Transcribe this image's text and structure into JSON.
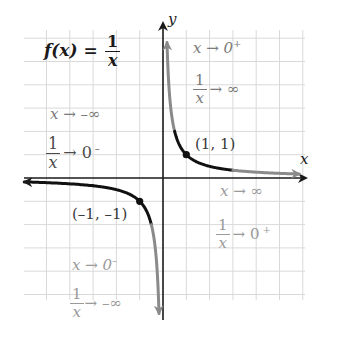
{
  "title": {
    "lhs": "f(x) =",
    "numerator": "1",
    "denominator": "x"
  },
  "axes": {
    "x_label": "x",
    "y_label": "y",
    "origin_px": [
      163,
      178
    ],
    "unit_px": 23.3,
    "grid_range_x": [
      -5,
      6
    ],
    "grid_range_y": [
      -6,
      6
    ]
  },
  "points": [
    {
      "label": "(1, 1)",
      "x": 1,
      "y": 1
    },
    {
      "label": "(-1, -1)",
      "display": "(–1, –1)",
      "x": -1,
      "y": -1
    }
  ],
  "annotations": {
    "q2_top": {
      "limit": "x → –∞",
      "value_num": "1",
      "value_den": "x",
      "value_tail": "→ 0",
      "value_sup": "–"
    },
    "q1_top": {
      "limit": "x → 0",
      "limit_sup": "+",
      "value_num": "1",
      "value_den": "x",
      "value_tail": "→ ∞"
    },
    "q4": {
      "limit": "x → ∞",
      "value_num": "1",
      "value_den": "x",
      "value_tail": "→ 0",
      "value_sup": "+"
    },
    "q3": {
      "limit": "x → 0",
      "limit_sup": "–",
      "value_num": "1",
      "value_den": "x",
      "value_tail": "→ –∞"
    }
  },
  "colors": {
    "axis": "#1a1a1a",
    "curve_near": "#111111",
    "curve_far": "#8a8a8a",
    "grid": "#d9d9d9",
    "text_dark": "#1a1a1a",
    "text_gray": "#8c8c8c"
  },
  "chart_data": {
    "type": "line",
    "xlabel": "x",
    "ylabel": "y",
    "series": [
      {
        "name": "f(x)=1/x, x>0",
        "x": [
          0.17,
          0.25,
          0.5,
          1,
          2,
          4,
          5.2
        ],
        "y": [
          5.9,
          4,
          2,
          1,
          0.5,
          0.25,
          0.19
        ]
      },
      {
        "name": "f(x)=1/x, x<0",
        "x": [
          -5.8,
          -4,
          -2,
          -1,
          -0.5,
          -0.25,
          -0.17
        ],
        "y": [
          -0.17,
          -0.25,
          -0.5,
          -1,
          -2,
          -4,
          -5.9
        ]
      }
    ],
    "labeled_points": [
      [
        1,
        1
      ],
      [
        -1,
        -1
      ]
    ],
    "grid": true,
    "xlim": [
      -6,
      6
    ],
    "ylim": [
      -6,
      6
    ]
  }
}
